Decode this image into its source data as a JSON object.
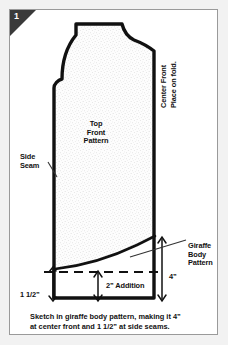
{
  "figure": {
    "number": "1",
    "caption_line1": "Sketch in giraffe body pattern, making it 4”",
    "caption_line2": "at center front and 1 1/2” at side seams."
  },
  "labels": {
    "top_front_pattern": "Top\nFront\nPattern",
    "side_seam": "Side\nSeam",
    "center_front": "Center Front",
    "place_on_fold": "Place on fold.",
    "giraffe_body_pattern": "Giraffe\nBody\nPattern",
    "four_inch": "4”",
    "two_inch_addition": "2” Addition",
    "one_and_half_inch": "1 1/2”"
  },
  "colors": {
    "page_background": "#f2f2f2",
    "panel_background": "#ffffff",
    "frame_border": "#9a9a9a",
    "badge_background": "#3a3a3a",
    "badge_text": "#ffffff",
    "outline_stroke": "#111111",
    "stipple_fill": "#fafafa",
    "leader_line": "#333333",
    "text": "#111111"
  },
  "diagram": {
    "type": "sewing-pattern-schematic",
    "pattern_piece": "Top Front Pattern",
    "fold_edge": "Center Front",
    "addition_at_center_front": "4”",
    "addition_at_side_seam": "1 1/2”",
    "addition_mid": "2”"
  }
}
